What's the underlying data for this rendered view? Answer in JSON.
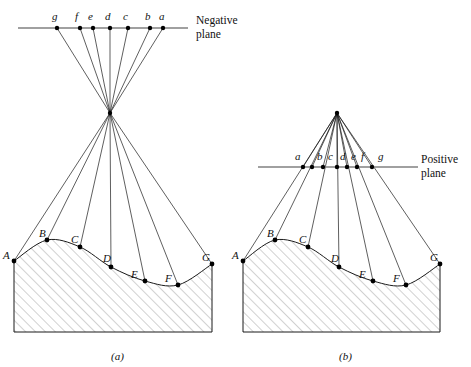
{
  "figure": {
    "type": "diagram",
    "panels": [
      {
        "id": "a",
        "caption": "(a)",
        "plane": {
          "name": "Negative plane",
          "label_lines": [
            "Negative",
            "plane"
          ],
          "label_x": 196,
          "label_y": 13,
          "line": {
            "x1": 18,
            "y1": 28,
            "x2": 188,
            "y2": 28
          },
          "points": [
            {
              "label": "g",
              "x": 57,
              "y": 28,
              "lx": 52,
              "ly": 10
            },
            {
              "label": "f",
              "x": 80,
              "y": 28,
              "lx": 75,
              "ly": 10
            },
            {
              "label": "e",
              "x": 93,
              "y": 28,
              "lx": 88,
              "ly": 10
            },
            {
              "label": "d",
              "x": 110,
              "y": 28,
              "lx": 105,
              "ly": 10
            },
            {
              "label": "c",
              "x": 128,
              "y": 28,
              "lx": 123,
              "ly": 10
            },
            {
              "label": "b",
              "x": 150,
              "y": 28,
              "lx": 145,
              "ly": 10
            },
            {
              "label": "a",
              "x": 163,
              "y": 28,
              "lx": 159,
              "ly": 10
            }
          ]
        },
        "center_of_projection": {
          "x": 110,
          "y": 113
        },
        "terrain": {
          "left": 14,
          "right": 212,
          "bottom": 332,
          "points": [
            {
              "label": "A",
              "x": 14,
              "y": 261,
              "lx": 3,
              "ly": 249
            },
            {
              "label": "B",
              "x": 47,
              "y": 240,
              "lx": 39,
              "ly": 227
            },
            {
              "label": "C",
              "x": 80,
              "y": 247,
              "lx": 71,
              "ly": 233
            },
            {
              "label": "D",
              "x": 111,
              "y": 267,
              "lx": 103,
              "ly": 252
            },
            {
              "label": "E",
              "x": 145,
              "y": 281,
              "lx": 131,
              "ly": 268
            },
            {
              "label": "F",
              "x": 178,
              "y": 285,
              "lx": 165,
              "ly": 272
            },
            {
              "label": "G",
              "x": 212,
              "y": 264,
              "lx": 202,
              "ly": 251
            }
          ]
        },
        "ray_map": [
          {
            "scene": "A",
            "image": "a"
          },
          {
            "scene": "B",
            "image": "b"
          },
          {
            "scene": "C",
            "image": "c"
          },
          {
            "scene": "D",
            "image": "d"
          },
          {
            "scene": "E",
            "image": "e"
          },
          {
            "scene": "F",
            "image": "f"
          },
          {
            "scene": "G",
            "image": "g"
          }
        ]
      },
      {
        "id": "b",
        "caption": "(b)",
        "plane": {
          "name": "Positive plane",
          "label_lines": [
            "Positive",
            "plane"
          ],
          "label_x": 421,
          "label_y": 152,
          "line": {
            "x1": 258,
            "y1": 167,
            "x2": 418,
            "y2": 167
          },
          "points": [
            {
              "label": "a",
              "x": 303,
              "y": 167,
              "lx": 295,
              "ly": 150
            },
            {
              "label": "b",
              "x": 312,
              "y": 167,
              "lx": 317,
              "ly": 150
            },
            {
              "label": "c",
              "x": 323,
              "y": 167,
              "lx": 328,
              "ly": 150
            },
            {
              "label": "d",
              "x": 337,
              "y": 167,
              "lx": 340,
              "ly": 150
            },
            {
              "label": "e",
              "x": 347,
              "y": 167,
              "lx": 351,
              "ly": 150
            },
            {
              "label": "f",
              "x": 357,
              "y": 167,
              "lx": 361,
              "ly": 150
            },
            {
              "label": "g",
              "x": 372,
              "y": 167,
              "lx": 378,
              "ly": 150
            }
          ]
        },
        "center_of_projection": {
          "x": 337,
          "y": 113
        },
        "terrain": {
          "left": 243,
          "right": 440,
          "bottom": 332,
          "points": [
            {
              "label": "A",
              "x": 243,
              "y": 261,
              "lx": 232,
              "ly": 249
            },
            {
              "label": "B",
              "x": 275,
              "y": 240,
              "lx": 267,
              "ly": 227
            },
            {
              "label": "C",
              "x": 308,
              "y": 247,
              "lx": 299,
              "ly": 233
            },
            {
              "label": "D",
              "x": 339,
              "y": 267,
              "lx": 331,
              "ly": 252
            },
            {
              "label": "E",
              "x": 373,
              "y": 281,
              "lx": 359,
              "ly": 268
            },
            {
              "label": "F",
              "x": 406,
              "y": 285,
              "lx": 393,
              "ly": 272
            },
            {
              "label": "G",
              "x": 440,
              "y": 264,
              "lx": 430,
              "ly": 251
            }
          ]
        },
        "ray_map": [
          {
            "scene": "A",
            "image": "a"
          },
          {
            "scene": "B",
            "image": "b"
          },
          {
            "scene": "C",
            "image": "c"
          },
          {
            "scene": "D",
            "image": "d"
          },
          {
            "scene": "E",
            "image": "e"
          },
          {
            "scene": "F",
            "image": "f"
          },
          {
            "scene": "G",
            "image": "g"
          }
        ]
      }
    ],
    "captions": [
      {
        "text": "(a)",
        "x": 111,
        "y": 350
      },
      {
        "text": "(b)",
        "x": 339,
        "y": 350
      }
    ],
    "colors": {
      "stroke": "#1a1a1a",
      "plane_line": "#808080",
      "hatch": "#9a9a9a",
      "background": "#ffffff",
      "dot": "#000000"
    }
  }
}
